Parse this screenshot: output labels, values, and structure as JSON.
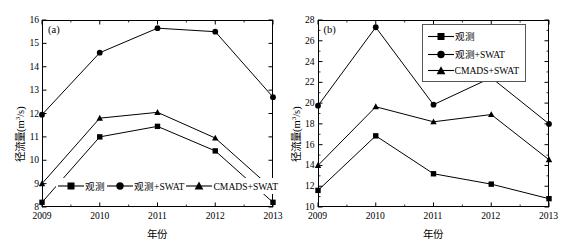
{
  "figure": {
    "panels": [
      {
        "tag": "(a)",
        "xlabel": "年份",
        "ylabel_main": "径流量(m",
        "ylabel_sup": "3",
        "ylabel_tail": "/s)",
        "legend_position": "inline-bottom",
        "legend": [
          "观测",
          "观测+SWAT",
          "CMADS+SWAT"
        ]
      },
      {
        "tag": "(b)",
        "xlabel": "年份",
        "ylabel_main": "径流量(m",
        "ylabel_sup": "3",
        "ylabel_tail": "/s)",
        "legend_position": "box-top-right",
        "legend": [
          "观测",
          "观测+SWAT",
          "CMADS+SWAT"
        ]
      }
    ]
  },
  "chart_data": [
    {
      "type": "line",
      "title": "(a)",
      "xlabel": "年份",
      "ylabel": "径流量(m3/s)",
      "categories": [
        "2009",
        "2010",
        "2011",
        "2012",
        "2013"
      ],
      "x": [
        2009,
        2010,
        2011,
        2012,
        2013
      ],
      "xlim": [
        2009,
        2013
      ],
      "ylim": [
        8,
        16
      ],
      "yticks": [
        8,
        9,
        10,
        11,
        12,
        13,
        14,
        15,
        16
      ],
      "xticks": [
        2009,
        2010,
        2011,
        2012,
        2013
      ],
      "grid": false,
      "legend_position": "lower center",
      "series": [
        {
          "name": "观测",
          "marker": "square",
          "values": [
            8.2,
            11.0,
            11.45,
            10.4,
            8.2
          ]
        },
        {
          "name": "观测+SWAT",
          "marker": "circle",
          "values": [
            11.95,
            14.6,
            15.65,
            15.5,
            12.7
          ]
        },
        {
          "name": "CMADS+SWAT",
          "marker": "triangle",
          "values": [
            9.0,
            11.8,
            12.05,
            10.95,
            8.75
          ]
        }
      ]
    },
    {
      "type": "line",
      "title": "(b)",
      "xlabel": "年份",
      "ylabel": "径流量(m3/s)",
      "categories": [
        "2009",
        "2010",
        "2011",
        "2012",
        "2013"
      ],
      "x": [
        2009,
        2010,
        2011,
        2012,
        2013
      ],
      "xlim": [
        2009,
        2013
      ],
      "ylim": [
        10,
        28
      ],
      "yticks": [
        10,
        12,
        14,
        16,
        18,
        20,
        22,
        24,
        26,
        28
      ],
      "xticks": [
        2009,
        2010,
        2011,
        2012,
        2013
      ],
      "grid": false,
      "legend_position": "upper right",
      "series": [
        {
          "name": "观测",
          "marker": "square",
          "values": [
            11.6,
            16.85,
            13.2,
            12.2,
            10.8
          ]
        },
        {
          "name": "观测+SWAT",
          "marker": "circle",
          "values": [
            19.75,
            27.3,
            19.85,
            22.45,
            18.0
          ]
        },
        {
          "name": "CMADS+SWAT",
          "marker": "triangle",
          "values": [
            14.0,
            19.65,
            18.2,
            18.9,
            14.55
          ]
        }
      ]
    }
  ],
  "style": {
    "line_color": "#000000",
    "marker_color": "#000000",
    "axis_color": "#000000",
    "background": "#ffffff"
  }
}
